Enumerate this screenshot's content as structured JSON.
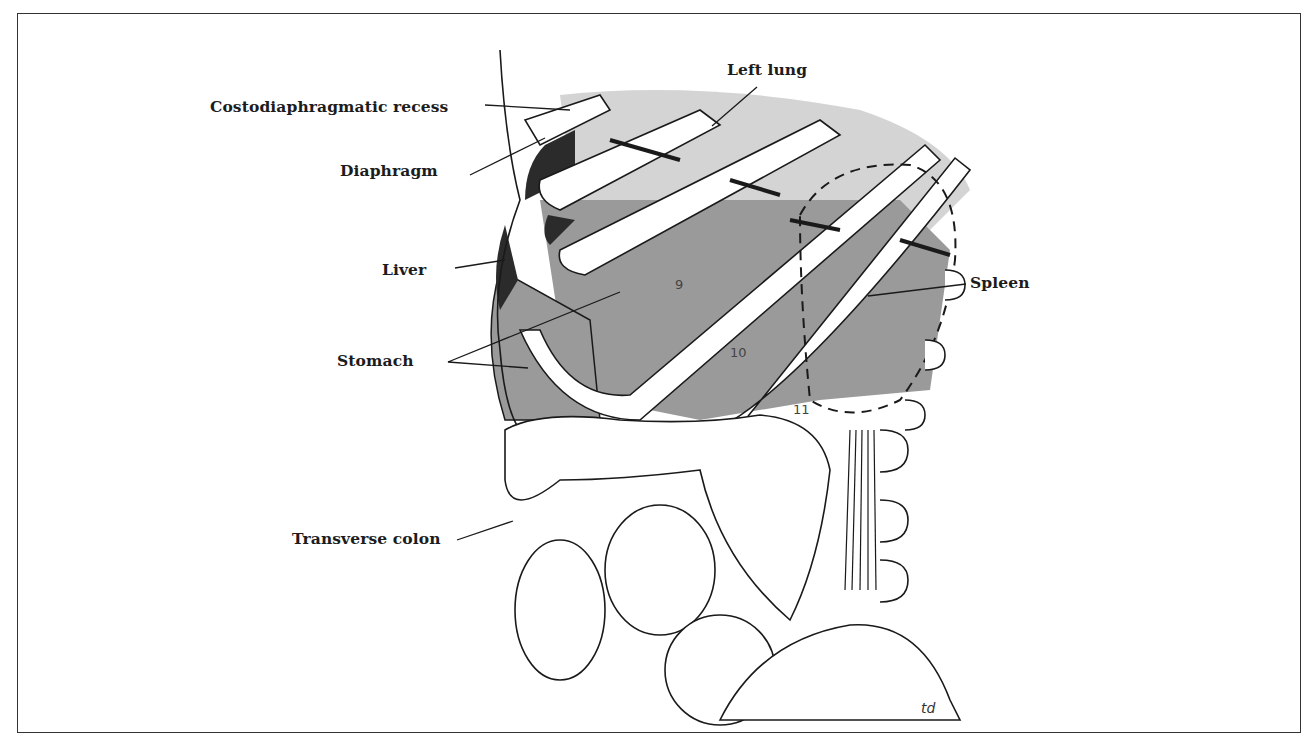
{
  "figure": {
    "labels": [
      {
        "id": "costodiaphragmatic-recess",
        "text": "Costodiaphragmatic recess"
      },
      {
        "id": "left-lung",
        "text": "Left lung"
      },
      {
        "id": "diaphragm",
        "text": "Diaphragm"
      },
      {
        "id": "liver",
        "text": "Liver"
      },
      {
        "id": "spleen",
        "text": "Spleen"
      },
      {
        "id": "stomach",
        "text": "Stomach"
      },
      {
        "id": "transverse-colon",
        "text": "Transverse colon"
      }
    ],
    "rib_numbers": [
      "9",
      "10",
      "11"
    ],
    "signature": "td"
  },
  "colors": {
    "line": "#1a1a1a",
    "lung": "#d4d4d4",
    "organ_gray": "#9a9a9a",
    "dark": "#2b2b2b",
    "background": "#ffffff"
  }
}
